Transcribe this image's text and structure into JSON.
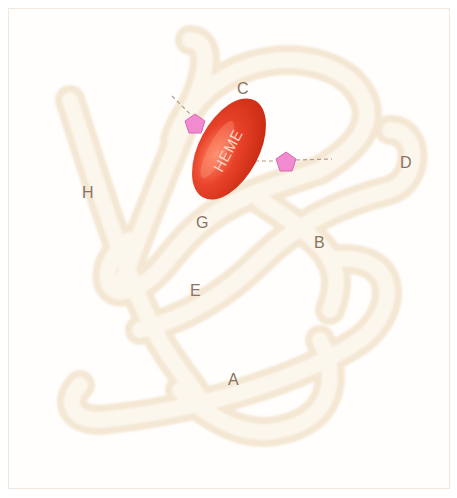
{
  "diagram": {
    "heme_label": "HEME",
    "helix_labels": {
      "A": "A",
      "B": "B",
      "C": "C",
      "D": "D",
      "E": "E",
      "G": "G",
      "H": "H"
    },
    "colors": {
      "backbone": "#f3e2c8",
      "backbone_light": "#fbf4e9",
      "heme": "#e2391f",
      "heme_highlight": "#ff7a5c",
      "histidine": "#f28ad0",
      "label": "#8a7362",
      "frame": "#f3e6dc"
    }
  }
}
